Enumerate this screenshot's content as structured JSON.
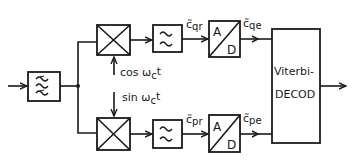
{
  "diagram": {
    "type": "block-diagram",
    "colors": {
      "stroke": "#1a1a1a",
      "background": "#ffffff"
    },
    "blocks": {
      "bandpass_filter": {
        "icon": "triple-tilde-filter"
      },
      "mixer_upper": {
        "icon": "multiplier-x"
      },
      "mixer_lower": {
        "icon": "multiplier-x"
      },
      "lowpass_upper": {
        "icon": "double-tilde-filter"
      },
      "lowpass_lower": {
        "icon": "double-tilde-filter"
      },
      "adc_upper": {
        "top": "A",
        "bottom": "D"
      },
      "adc_lower": {
        "top": "A",
        "bottom": "D"
      },
      "viterbi": {
        "line1": "Viterbi-",
        "line2": "DECOD"
      }
    },
    "labels": {
      "cos": {
        "fn": "cos ω",
        "sub": "c",
        "tail": "t"
      },
      "sin": {
        "fn": "sin ω",
        "sub": "c",
        "tail": "t"
      },
      "c_qr": {
        "base": "c̃",
        "sub": "qr"
      },
      "c_qe": {
        "base": "c̃",
        "sub": "qe"
      },
      "c_pr": {
        "base": "c̃",
        "sub": "pr"
      },
      "c_pe": {
        "base": "c̃",
        "sub": "pe"
      }
    }
  }
}
